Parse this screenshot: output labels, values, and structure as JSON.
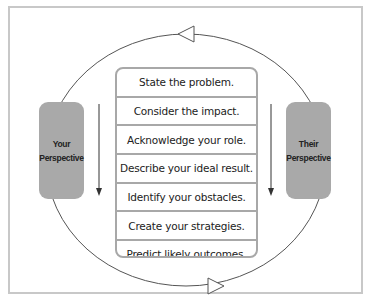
{
  "diagram": {
    "left_box": {
      "line1": "Your",
      "line2": "Perspective"
    },
    "right_box": {
      "line1": "Their",
      "line2": "Perspective"
    },
    "steps": [
      "State the problem.",
      "Consider the impact.",
      "Acknowledge your role.",
      "Describe your ideal result.",
      "Identify your obstacles.",
      "Create your strategies.",
      "Predict likely outcomes."
    ],
    "cycle_direction": "counterclockwise-top-left / clockwise-bottom-right arrows",
    "colors": {
      "box_fill": "#a9a9a9",
      "border": "#a8a8a8",
      "line": "#444444"
    }
  }
}
